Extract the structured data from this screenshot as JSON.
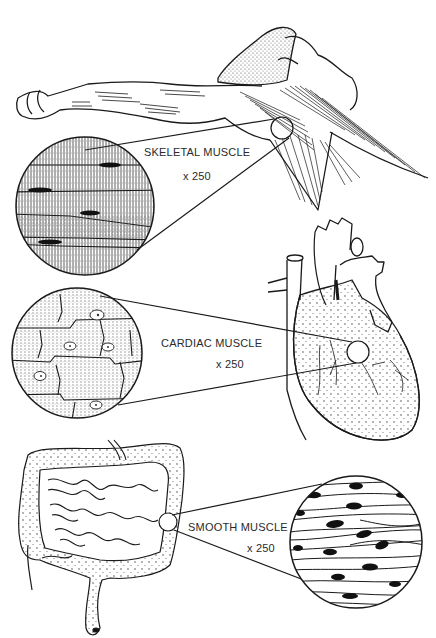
{
  "diagram": {
    "type": "anatomical-illustration",
    "style": "black ink line art on white",
    "panels": [
      {
        "id": "skeletal",
        "organ": "arm-and-shoulder",
        "label": "SKELETAL MUSCLE",
        "magnification": "x 250",
        "micro_features": "striated, parallel multinucleate fibers with peripheral nuclei"
      },
      {
        "id": "cardiac",
        "organ": "heart",
        "label": "CARDIAC MUSCLE",
        "magnification": "x 250",
        "micro_features": "branched striated cells with intercalated discs and central nuclei"
      },
      {
        "id": "smooth",
        "organ": "intestines",
        "label": "SMOOTH MUSCLE",
        "magnification": "x 250",
        "micro_features": "spindle-shaped non-striated cells with elongated central nuclei"
      }
    ]
  },
  "colors": {
    "ink": "#1a1a1a",
    "text": "#2a2a2a",
    "background": "#ffffff",
    "stipple": "#555555"
  }
}
